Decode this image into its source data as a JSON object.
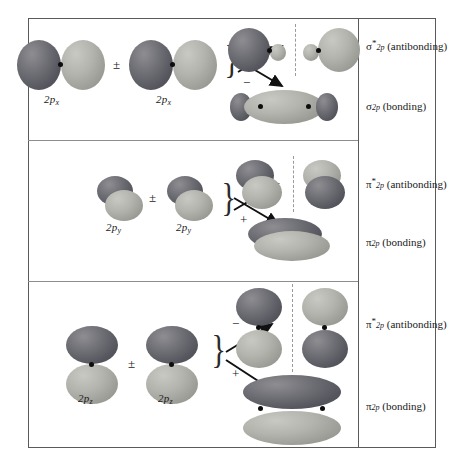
{
  "figure": {
    "frame_border_color": "#5a5a5a",
    "lobe_dark_color": "#55555d",
    "lobe_light_color": "#9b9b95",
    "nucleus_dot_color": "#0d0d0d",
    "nodal_plane_color": "#9a9a9a"
  },
  "rows": [
    {
      "id": "sigma-2p",
      "left_orbital_label": "2p",
      "left_orbital_sub": "x",
      "right_orbital_label": "2p",
      "right_orbital_sub": "x",
      "combine_symbol": "±",
      "upper_sign": "+",
      "lower_sign": "−",
      "upper_result": {
        "greek": "σ",
        "star": "*",
        "sub": "2p",
        "kind": "(antibonding)"
      },
      "lower_result": {
        "greek": "σ",
        "star": "",
        "sub": "2p",
        "kind": "(bonding)"
      }
    },
    {
      "id": "pi-2py",
      "left_orbital_label": "2p",
      "left_orbital_sub": "y",
      "right_orbital_label": "2p",
      "right_orbital_sub": "y",
      "combine_symbol": "±",
      "upper_sign": "−",
      "lower_sign": "+",
      "upper_result": {
        "greek": "π",
        "star": "*",
        "sub": "2p",
        "kind": "(antibonding)"
      },
      "lower_result": {
        "greek": "π",
        "star": "",
        "sub": "2p",
        "kind": "(bonding)"
      }
    },
    {
      "id": "pi-2pz",
      "left_orbital_label": "2p",
      "left_orbital_sub": "z",
      "right_orbital_label": "2p",
      "right_orbital_sub": "z",
      "combine_symbol": "±",
      "upper_sign": "−",
      "lower_sign": "+",
      "upper_result": {
        "greek": "π",
        "star": "*",
        "sub": "2p",
        "kind": "(antibonding)"
      },
      "lower_result": {
        "greek": "π",
        "star": "",
        "sub": "2p",
        "kind": "(bonding)"
      }
    }
  ]
}
